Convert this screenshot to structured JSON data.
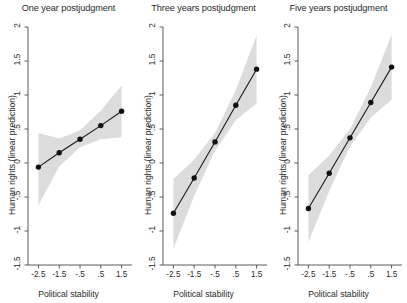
{
  "figure": {
    "background_color": "#ffffff",
    "axis_color": "#4a4a4a",
    "line_color": "#1a1a1a",
    "marker_color": "#111111",
    "band_color": "#dcdcdc"
  },
  "chart_data": [
    {
      "type": "line",
      "title": "One year postjudgment",
      "xlabel": "Political stability",
      "ylabel": "Human rights (linear prediction)",
      "x": [
        -2.5,
        -1.5,
        -0.5,
        0.5,
        1.5
      ],
      "values": [
        -0.06,
        0.15,
        0.35,
        0.55,
        0.76
      ],
      "ci_lower": [
        -0.62,
        -0.05,
        0.23,
        0.35,
        0.38
      ],
      "ci_upper": [
        0.44,
        0.36,
        0.48,
        0.77,
        1.14
      ],
      "xlim": [
        -3.0,
        2.0
      ],
      "ylim": [
        -1.5,
        2.0
      ],
      "xticks": [
        -2.5,
        -1.5,
        -0.5,
        0.5,
        1.5
      ],
      "xtick_labels": [
        "-2.5",
        "-1.5",
        "-.5",
        ".5",
        "1.5"
      ],
      "yticks": [
        -1.5,
        -1.0,
        -0.5,
        0.0,
        0.5,
        1.0,
        1.5,
        2.0
      ],
      "ytick_labels": [
        "-1.5",
        "-1",
        "-.5",
        "0",
        ".5",
        "1",
        "1.5",
        "2"
      ],
      "grid": false,
      "legend": "none"
    },
    {
      "type": "line",
      "title": "Three years postjudgment",
      "xlabel": "Political stability",
      "ylabel": "Human rights (linear prediction)",
      "x": [
        -2.5,
        -1.5,
        -0.5,
        0.5,
        1.5
      ],
      "values": [
        -0.74,
        -0.22,
        0.31,
        0.85,
        1.38
      ],
      "ci_lower": [
        -1.26,
        -0.48,
        0.18,
        0.63,
        0.88
      ],
      "ci_upper": [
        -0.24,
        0.05,
        0.44,
        1.07,
        1.88
      ],
      "xlim": [
        -3.0,
        2.0
      ],
      "ylim": [
        -1.5,
        2.0
      ],
      "xticks": [
        -2.5,
        -1.5,
        -0.5,
        0.5,
        1.5
      ],
      "xtick_labels": [
        "-2.5",
        "-1.5",
        "-.5",
        ".5",
        "1.5"
      ],
      "yticks": [
        -1.5,
        -1.0,
        -0.5,
        0.0,
        0.5,
        1.0,
        1.5,
        2.0
      ],
      "ytick_labels": [
        "-1.5",
        "-1",
        "-.5",
        "0",
        ".5",
        "1",
        "1.5",
        "2"
      ],
      "grid": false,
      "legend": "none"
    },
    {
      "type": "line",
      "title": "Five years postjudgment",
      "xlabel": "Political stability",
      "ylabel": "Human rights (linear prediction)",
      "x": [
        -2.5,
        -1.5,
        -0.5,
        0.5,
        1.5
      ],
      "values": [
        -0.67,
        -0.15,
        0.37,
        0.89,
        1.41
      ],
      "ci_lower": [
        -1.16,
        -0.41,
        0.24,
        0.67,
        0.93
      ],
      "ci_upper": [
        -0.18,
        0.11,
        0.5,
        1.11,
        1.89
      ],
      "xlim": [
        -3.0,
        2.0
      ],
      "ylim": [
        -1.5,
        2.0
      ],
      "xticks": [
        -2.5,
        -1.5,
        -0.5,
        0.5,
        1.5
      ],
      "xtick_labels": [
        "-2.5",
        "-1.5",
        "-.5",
        ".5",
        "1.5"
      ],
      "yticks": [
        -1.5,
        -1.0,
        -0.5,
        0.0,
        0.5,
        1.0,
        1.5,
        2.0
      ],
      "ytick_labels": [
        "-1.5",
        "-1",
        "-.5",
        "0",
        ".5",
        "1",
        "1.5",
        "2"
      ],
      "grid": false,
      "legend": "none"
    }
  ]
}
